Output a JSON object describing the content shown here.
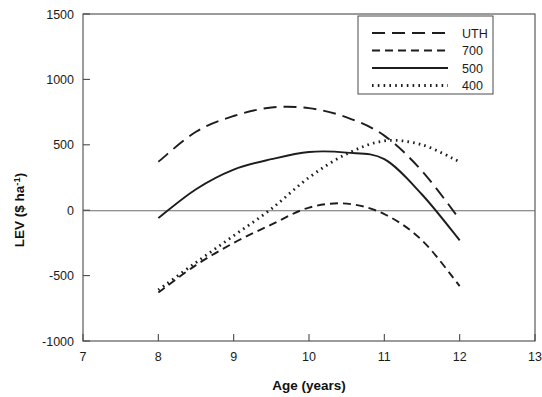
{
  "chart_data": {
    "type": "line",
    "title": "",
    "xlabel": "Age (years)",
    "ylabel": "LEV ($ ha-1)",
    "ylabel_base": "LEV ($ ha",
    "ylabel_sup": "-1",
    "ylabel_tail": ")",
    "xlim": [
      7,
      13
    ],
    "ylim": [
      -1000,
      1500
    ],
    "xticks": [
      7,
      8,
      9,
      10,
      11,
      12,
      13
    ],
    "xtick_labels": [
      "7",
      "8",
      "9",
      "10",
      "11",
      "12",
      "13"
    ],
    "yticks": [
      -1000,
      -500,
      0,
      500,
      1000,
      1500
    ],
    "ytick_labels": [
      "-1000",
      "-500",
      "0",
      "500",
      "1000",
      "1500"
    ],
    "grid": false,
    "zero_line": true,
    "legend_position": "top-right",
    "x": [
      8,
      8.5,
      9,
      9.5,
      10,
      10.5,
      11,
      11.5,
      12
    ],
    "series": [
      {
        "name": "UTH",
        "label": "UTH",
        "dash": "long-dash",
        "dasharray": "13,7",
        "width": 1.9,
        "color": "#1d1d1d",
        "values": [
          370,
          600,
          720,
          785,
          780,
          710,
          570,
          300,
          -70
        ]
      },
      {
        "name": "700",
        "label": "700",
        "dash": "medium-dash",
        "dasharray": "8,5",
        "width": 1.9,
        "color": "#1d1d1d",
        "values": [
          -630,
          -420,
          -250,
          -110,
          20,
          50,
          -30,
          -230,
          -580
        ]
      },
      {
        "name": "500",
        "label": "500",
        "dash": "solid",
        "dasharray": "none",
        "width": 1.9,
        "color": "#1d1d1d",
        "values": [
          -60,
          160,
          310,
          390,
          445,
          440,
          390,
          120,
          -230
        ]
      },
      {
        "name": "400",
        "label": "400",
        "dash": "dotted",
        "dasharray": "1.6,4.2",
        "width": 2.8,
        "color": "#1d1d1d",
        "values": [
          -610,
          -400,
          -195,
          10,
          250,
          430,
          530,
          500,
          370
        ]
      }
    ]
  },
  "legend": {
    "entries": [
      "UTH",
      "700",
      "500",
      "400"
    ]
  },
  "axes": {
    "x_title": "Age (years)"
  }
}
